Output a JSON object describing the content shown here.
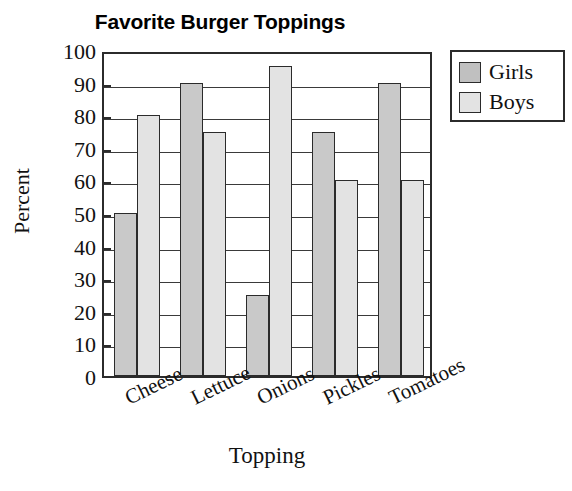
{
  "chart_data": {
    "type": "bar",
    "title": "Favorite Burger Toppings",
    "xlabel": "Topping",
    "ylabel": "Percent",
    "categories": [
      "Cheese",
      "Lettuce",
      "Onions",
      "Pickles",
      "Tomatoes"
    ],
    "series": [
      {
        "name": "Girls",
        "values": [
          50,
          90,
          25,
          75,
          90
        ],
        "color": "#c9c9c9"
      },
      {
        "name": "Boys",
        "values": [
          80,
          75,
          95,
          60,
          60
        ],
        "color": "#e3e3e3"
      }
    ],
    "ylim": [
      0,
      100
    ],
    "yticks": [
      0,
      10,
      20,
      30,
      40,
      50,
      60,
      70,
      80,
      90,
      100
    ],
    "ytick_labels": [
      "0",
      "10",
      "20",
      "30",
      "40",
      "50",
      "60",
      "70",
      "80",
      "90",
      "100"
    ],
    "grid": true,
    "grid_axis": "y",
    "legend_position": "right-top",
    "legend_entries": [
      "Girls",
      "Boys"
    ],
    "xtick_rotation": -26
  }
}
